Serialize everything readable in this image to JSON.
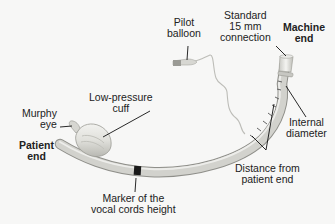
{
  "diagram": {
    "labels": {
      "pilot_balloon": [
        "Pilot",
        "balloon"
      ],
      "standard_connection": [
        "Standard",
        "15 mm",
        "connection"
      ],
      "machine_end": [
        "Machine",
        "end"
      ],
      "low_pressure_cuff": [
        "Low-pressure",
        "cuff"
      ],
      "murphy_eye": [
        "Murphy",
        "eye"
      ],
      "patient_end": [
        "Patient",
        "end"
      ],
      "internal_diameter": [
        "Internal",
        "diameter"
      ],
      "distance_from_patient_end": [
        "Distance from",
        "patient end"
      ],
      "vocal_cords_marker": [
        "Marker of the",
        "vocal cords height"
      ]
    },
    "colors": {
      "background": "#f7f7f6",
      "tube": "#cfcfca",
      "tube_highlight": "#ececea",
      "tube_shadow": "#9e9e98",
      "marker": "#1a1a1a",
      "leader_line": "#111111",
      "text": "#222222"
    }
  }
}
